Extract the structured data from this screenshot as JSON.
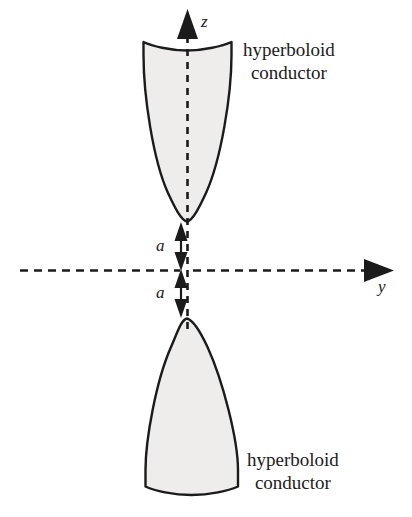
{
  "figure": {
    "background_color": "#ffffff",
    "stroke_color": "#1b1b1b",
    "fill_color": "#eeedeb",
    "width": 412,
    "height": 517
  },
  "axes": {
    "vertical": {
      "name": "z-axis",
      "label": "z",
      "style": "dashed",
      "direction": "up"
    },
    "horizontal": {
      "name": "y-axis",
      "label": "y",
      "style": "dashed",
      "direction": "right"
    },
    "origin_label": "O"
  },
  "dimensions": [
    {
      "label": "a",
      "description": "distance from origin to upper hyperboloid vertex"
    },
    {
      "label": "a",
      "description": "distance from origin to lower hyperboloid vertex"
    }
  ],
  "conductors": [
    {
      "position": "upper",
      "caption_line1": "hyperboloid",
      "caption_line2": "conductor"
    },
    {
      "position": "lower",
      "caption_line1": "hyperboloid",
      "caption_line2": "conductor"
    }
  ]
}
